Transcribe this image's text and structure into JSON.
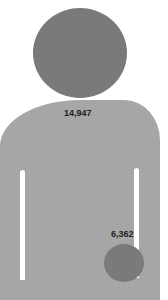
{
  "chart_data": {
    "type": "pictograph",
    "title": "",
    "series": [
      {
        "name": "total",
        "value": 14947,
        "label": "14,947",
        "shape": "person-body",
        "color": "#a6a6a6"
      },
      {
        "name": "subset",
        "value": 6362,
        "label": "6,362",
        "shape": "circle",
        "color": "#7a7a7a"
      }
    ],
    "head_color": "#7a7a7a"
  },
  "labels": {
    "total": "14,947",
    "subset": "6,362"
  }
}
